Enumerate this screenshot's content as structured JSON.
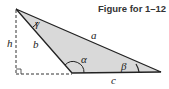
{
  "title": "Figure for 1–12",
  "labels": {
    "a": "a",
    "b": "b",
    "c": "c",
    "h": "h",
    "alpha": "α",
    "beta": "β",
    "gamma": "γ"
  },
  "colors": {
    "fill": "#d9d9d9",
    "stroke": "#222222",
    "dashed": "#333333"
  }
}
